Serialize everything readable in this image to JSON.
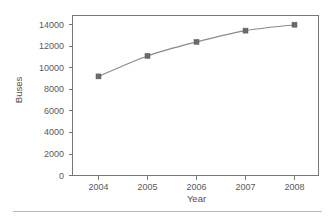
{
  "chart_data": {
    "type": "line",
    "title": "",
    "xlabel": "Year",
    "ylabel": "Buses",
    "x": [
      2004,
      2005,
      2006,
      2007,
      2008
    ],
    "categories": [
      "2004",
      "2005",
      "2006",
      "2007",
      "2008"
    ],
    "values": [
      9200,
      11100,
      12400,
      13450,
      14000
    ],
    "series": [
      {
        "name": "Buses",
        "values": [
          9200,
          11100,
          12400,
          13450,
          14000
        ]
      }
    ],
    "ylim": [
      0,
      15000
    ],
    "xlim": [
      2003.5,
      2008.5
    ],
    "yticks": [
      0,
      2000,
      4000,
      6000,
      8000,
      10000,
      12000,
      14000
    ],
    "ytick_labels": [
      "0",
      "2000",
      "4000",
      "6000",
      "8000",
      "10000",
      "12000",
      "14000"
    ],
    "xticks": [
      2004,
      2005,
      2006,
      2007,
      2008
    ],
    "xtick_labels": [
      "2004",
      "2005",
      "2006",
      "2007",
      "2008"
    ],
    "grid": false,
    "legend": false,
    "legend_position": "none",
    "marker": "square",
    "line_color": "#8a8a8a",
    "marker_color": "#6b6b6b",
    "frame_color": "#777777",
    "text_color": "#5a5a5a",
    "background_color": "#ffffff"
  },
  "axis": {
    "y_title": "Buses",
    "x_title": "Year",
    "y_tick_0": "0",
    "y_tick_1": "2000",
    "y_tick_2": "4000",
    "y_tick_3": "6000",
    "y_tick_4": "8000",
    "y_tick_5": "10000",
    "y_tick_6": "12000",
    "y_tick_7": "14000",
    "x_tick_0": "2004",
    "x_tick_1": "2005",
    "x_tick_2": "2006",
    "x_tick_3": "2007",
    "x_tick_4": "2008"
  }
}
